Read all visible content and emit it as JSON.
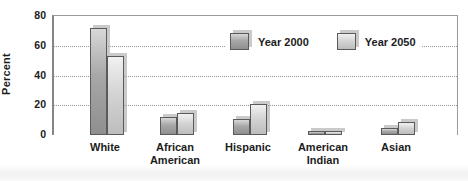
{
  "chart_data": {
    "type": "bar",
    "title": "",
    "xlabel": "",
    "ylabel": "Percent",
    "ylim": [
      0,
      80
    ],
    "yticks": [
      0,
      20,
      40,
      60,
      80
    ],
    "gridlines": {
      "style": "dotted",
      "at": [
        20,
        40,
        60
      ]
    },
    "legend_position": "top-center-inside",
    "categories": [
      "White",
      "African American",
      "Hispanic",
      "American Indian",
      "Asian"
    ],
    "category_label_lines": [
      [
        "White"
      ],
      [
        "African",
        "American"
      ],
      [
        "Hispanic"
      ],
      [
        "American",
        "Indian"
      ],
      [
        "Asian"
      ]
    ],
    "series": [
      {
        "name": "Year 2000",
        "values": [
          72,
          12,
          11,
          2,
          5
        ]
      },
      {
        "name": "Year 2050",
        "values": [
          53,
          15,
          21,
          2,
          9
        ]
      }
    ],
    "colors": {
      "year_2000_fill_top": "#d8d8d8",
      "year_2000_fill_bottom": "#8f8f8f",
      "year_2050_fill_top": "#f1f1f1",
      "year_2050_fill_bottom": "#bdbdbd",
      "bar_border": "#5a5a5a",
      "axis": "#868686",
      "grid": "#979797",
      "text": "#1c1c1c",
      "background": "#ffffff"
    }
  }
}
